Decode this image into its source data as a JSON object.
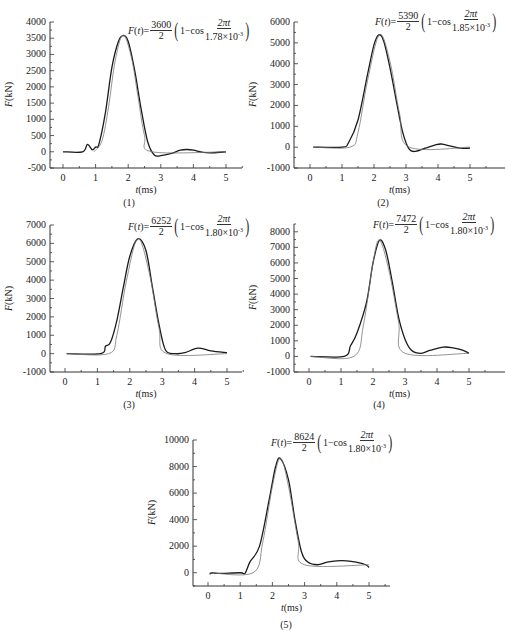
{
  "figure": {
    "panels": [
      {
        "caption": "(1)",
        "amplitude": "3600",
        "period": "1.78×10",
        "exp": "-3"
      },
      {
        "caption": "(2)",
        "amplitude": "5390",
        "period": "1.85×10",
        "exp": "-3"
      },
      {
        "caption": "(3)",
        "amplitude": "6252",
        "period": "1.80×10",
        "exp": "-3"
      },
      {
        "caption": "(4)",
        "amplitude": "7472",
        "period": "1.80×10",
        "exp": "-3"
      },
      {
        "caption": "(5)",
        "amplitude": "8624",
        "period": "1.80×10",
        "exp": "-3"
      }
    ],
    "formula_prefix": "F(t)=",
    "formula_denominator": "2",
    "formula_one_minus_cos": "1−cos",
    "formula_numerator_inner": "2πt",
    "xlabel": "t(ms)",
    "ylabel": "F(kN)"
  },
  "chart_data": [
    {
      "type": "line",
      "title": "(1)",
      "annotation": "F(t)=3600/2 (1−cos 2πt/1.78×10^-3)",
      "xlabel": "t(ms)",
      "ylabel": "F(kN)",
      "xlim": [
        -0.4,
        5.5
      ],
      "ylim": [
        -500,
        4000
      ],
      "xticks": [
        0,
        1,
        2,
        3,
        4,
        5
      ],
      "yticks": [
        -500,
        0,
        500,
        1000,
        1500,
        2000,
        2500,
        3000,
        3500,
        4000
      ],
      "series": [
        {
          "name": "measured",
          "x": [
            0,
            0.6,
            0.75,
            0.9,
            1.0,
            1.1,
            1.3,
            1.5,
            1.7,
            1.85,
            2.0,
            2.2,
            2.4,
            2.6,
            2.8,
            3.0,
            3.3,
            3.6,
            3.8,
            4.0,
            4.3,
            4.6,
            5.0
          ],
          "y": [
            0,
            0,
            230,
            60,
            150,
            230,
            1200,
            2600,
            3400,
            3580,
            3400,
            2500,
            1300,
            300,
            -100,
            -120,
            -60,
            50,
            70,
            50,
            -20,
            -30,
            0
          ]
        },
        {
          "name": "fit",
          "x": [
            0.95,
            1.2,
            1.4,
            1.6,
            1.84,
            2.1,
            2.3,
            2.5,
            2.73,
            5.0
          ],
          "y": [
            0,
            350,
            1400,
            2800,
            3600,
            2900,
            1700,
            500,
            0,
            0
          ]
        }
      ]
    },
    {
      "type": "line",
      "title": "(2)",
      "annotation": "F(t)=5390/2 (1−cos 2πt/1.85×10^-3)",
      "xlabel": "t(ms)",
      "ylabel": "F(kN)",
      "xlim": [
        -0.4,
        5.5
      ],
      "ylim": [
        -1000,
        6000
      ],
      "xticks": [
        0,
        1,
        2,
        3,
        4,
        5
      ],
      "yticks": [
        -1000,
        0,
        1000,
        2000,
        3000,
        4000,
        5000,
        6000
      ],
      "series": [
        {
          "name": "measured",
          "x": [
            0.1,
            1.0,
            1.2,
            1.5,
            1.8,
            2.0,
            2.15,
            2.3,
            2.5,
            2.7,
            2.9,
            3.1,
            3.3,
            3.6,
            3.9,
            4.1,
            4.4,
            4.7,
            5.0
          ],
          "y": [
            0,
            0,
            200,
            1300,
            3500,
            4900,
            5380,
            5100,
            3800,
            2200,
            700,
            -100,
            -200,
            -50,
            100,
            150,
            50,
            -50,
            -50
          ]
        },
        {
          "name": "fit",
          "x": [
            0.1,
            1.25,
            1.5,
            1.8,
            2.17,
            2.5,
            2.8,
            3.1,
            5.0
          ],
          "y": [
            0,
            0,
            700,
            3200,
            5390,
            4100,
            1600,
            0,
            0
          ]
        }
      ]
    },
    {
      "type": "line",
      "title": "(3)",
      "annotation": "F(t)=6252/2 (1−cos 2πt/1.80×10^-3)",
      "xlabel": "t(ms)",
      "ylabel": "F(kN)",
      "xlim": [
        -0.4,
        5.5
      ],
      "ylim": [
        -1000,
        7000
      ],
      "xticks": [
        0,
        1,
        2,
        3,
        4,
        5
      ],
      "yticks": [
        -1000,
        0,
        1000,
        2000,
        3000,
        4000,
        5000,
        6000,
        7000
      ],
      "series": [
        {
          "name": "measured",
          "x": [
            0.05,
            1.1,
            1.25,
            1.4,
            1.6,
            1.8,
            2.0,
            2.25,
            2.5,
            2.7,
            2.9,
            3.1,
            3.4,
            3.7,
            4.1,
            4.5,
            5.0
          ],
          "y": [
            0,
            0,
            400,
            600,
            1800,
            3600,
            5300,
            6250,
            5600,
            3600,
            1600,
            200,
            0,
            50,
            300,
            150,
            50
          ]
        },
        {
          "name": "fit",
          "x": [
            0.05,
            1.35,
            1.6,
            1.9,
            2.25,
            2.6,
            2.9,
            3.15,
            5.0
          ],
          "y": [
            0,
            0,
            1000,
            4000,
            6252,
            4400,
            1400,
            0,
            0
          ]
        }
      ]
    },
    {
      "type": "line",
      "title": "(4)",
      "annotation": "F(t)=7472/2 (1−cos 2πt/1.80×10^-3)",
      "xlabel": "t(ms)",
      "ylabel": "F(kN)",
      "xlim": [
        -0.4,
        5.5
      ],
      "ylim": [
        -1000,
        8500
      ],
      "xticks": [
        0,
        1,
        2,
        3,
        4,
        5
      ],
      "yticks": [
        -1000,
        0,
        1000,
        2000,
        3000,
        4000,
        5000,
        6000,
        7000,
        8000
      ],
      "series": [
        {
          "name": "measured",
          "x": [
            0.05,
            1.1,
            1.3,
            1.5,
            1.8,
            2.0,
            2.2,
            2.4,
            2.6,
            2.8,
            3.0,
            3.2,
            3.5,
            3.8,
            4.2,
            4.5,
            4.8,
            5.0
          ],
          "y": [
            0,
            0,
            700,
            1500,
            3500,
            6000,
            7450,
            6800,
            4800,
            2500,
            1100,
            400,
            200,
            400,
            600,
            550,
            400,
            200
          ]
        },
        {
          "name": "fit",
          "x": [
            0.05,
            1.4,
            1.7,
            2.0,
            2.2,
            2.5,
            2.8,
            3.0,
            5.0
          ],
          "y": [
            0,
            0,
            2000,
            6000,
            7472,
            5500,
            2200,
            200,
            200
          ]
        }
      ]
    },
    {
      "type": "line",
      "title": "(5)",
      "annotation": "F(t)=8624/2 (1−cos 2πt/1.80×10^-3)",
      "xlabel": "t(ms)",
      "ylabel": "F(kN)",
      "xlim": [
        -0.4,
        5.5
      ],
      "ylim": [
        -1000,
        10000
      ],
      "xticks": [
        0,
        1,
        2,
        3,
        4,
        5
      ],
      "yticks": [
        0,
        2000,
        4000,
        6000,
        8000,
        10000
      ],
      "series": [
        {
          "name": "measured",
          "x": [
            0.05,
            0.15,
            0.3,
            1.0,
            1.15,
            1.3,
            1.6,
            1.9,
            2.1,
            2.25,
            2.5,
            2.7,
            2.9,
            3.1,
            3.4,
            3.7,
            4.0,
            4.3,
            4.6,
            4.9,
            5.0
          ],
          "y": [
            -100,
            0,
            -50,
            0,
            -50,
            800,
            2000,
            5500,
            8000,
            8600,
            7000,
            4000,
            1600,
            800,
            600,
            800,
            900,
            900,
            800,
            600,
            400
          ]
        },
        {
          "name": "fit",
          "x": [
            0.05,
            1.4,
            1.7,
            2.0,
            2.25,
            2.5,
            2.8,
            3.0,
            5.0
          ],
          "y": [
            0,
            0,
            2300,
            6500,
            8624,
            6500,
            2400,
            600,
            600
          ]
        }
      ]
    }
  ]
}
